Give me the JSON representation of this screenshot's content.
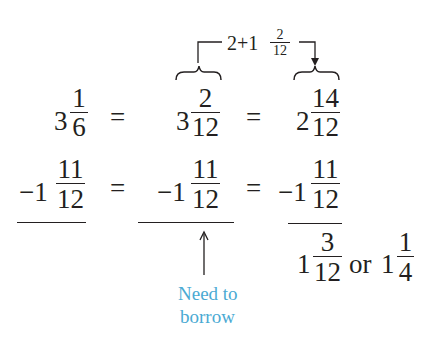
{
  "annotation_top": {
    "whole": "2+1",
    "num": "2",
    "den": "12"
  },
  "row1": {
    "a_whole": "3",
    "a_num": "1",
    "a_den": "6",
    "eq1": "=",
    "b_whole": "3",
    "b_num": "2",
    "b_den": "12",
    "eq2": "=",
    "c_whole": "2",
    "c_num": "14",
    "c_den": "12"
  },
  "row2": {
    "a_whole": "−1",
    "a_num": "11",
    "a_den": "12",
    "eq1": "=",
    "b_whole": "−1",
    "b_num": "11",
    "b_den": "12",
    "eq2": "=",
    "c_whole": "−1",
    "c_num": "11",
    "c_den": "12"
  },
  "result": {
    "r1_whole": "1",
    "r1_num": "3",
    "r1_den": "12",
    "or": "or",
    "r2_whole": "1",
    "r2_num": "1",
    "r2_den": "4"
  },
  "note": {
    "line1": "Need to",
    "line2": "borrow",
    "color": "#4aaad3"
  }
}
